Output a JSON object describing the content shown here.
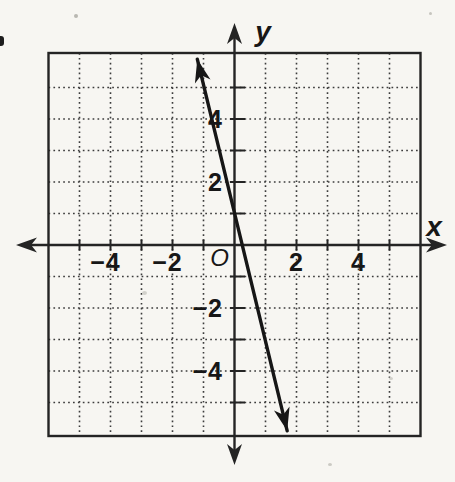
{
  "figure": {
    "background_color": "#f7f6f2",
    "ink_color": "#242424",
    "grid_dot_color": "#3c3c3c",
    "line_color": "#161616"
  },
  "chart_data": {
    "type": "line",
    "title": "",
    "xlabel": "x",
    "ylabel": "y",
    "origin_label": "O",
    "xlim": [
      -6,
      6
    ],
    "ylim": [
      -6,
      6
    ],
    "grid": "dotted, every 1 unit",
    "grid_step": 1,
    "tick_step": 1,
    "x_tick_labels": [
      -4,
      -2,
      2,
      4
    ],
    "y_tick_labels": [
      4,
      2,
      -2,
      -4
    ],
    "axes_arrows": "both ends",
    "series": [
      {
        "name": "graphed-line",
        "slope": -4,
        "y_intercept": 1,
        "x_intercept": 0.25,
        "points": [
          [
            -1,
            5
          ],
          [
            0,
            1
          ],
          [
            0.25,
            0
          ],
          [
            1,
            -3
          ]
        ],
        "segment": [
          [
            -1.2,
            5.9
          ],
          [
            1.7,
            -5.9
          ]
        ],
        "arrow_ends": true
      }
    ]
  }
}
